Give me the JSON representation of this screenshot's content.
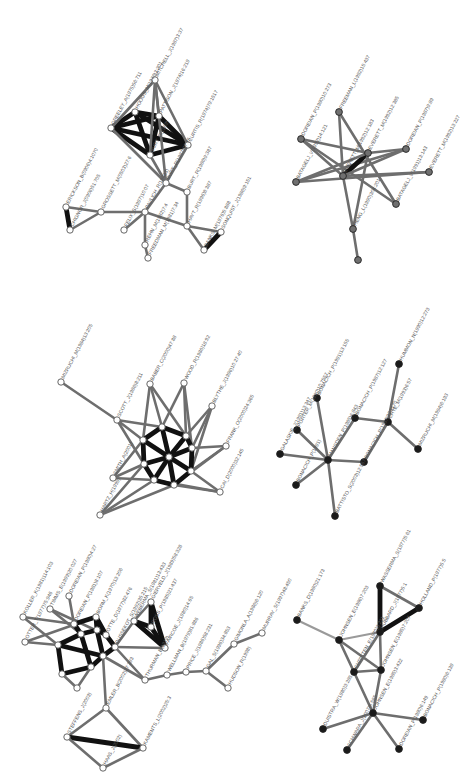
{
  "figure": {
    "colors": {
      "edge_light": "#9a9a9a",
      "edge_mid": "#6e6e6e",
      "edge_dark": "#111111",
      "node_white_fill": "#ffffff",
      "node_gray_fill": "#707070",
      "node_black_fill": "#1a1a1a",
      "node_stroke": "#555555"
    }
  },
  "graphs": [
    {
      "id": "top-left",
      "node_style": "white",
      "nodes": [
        {
          "id": "n1",
          "label": "ERICKSON_B(0906)4:1070",
          "x": 66,
          "y": 207
        },
        {
          "id": "n2",
          "label": "CHIGNOR_J(0906)51:705",
          "x": 70,
          "y": 230
        },
        {
          "id": "n3",
          "label": "GROSSETT_M(0503)27:6",
          "x": 101,
          "y": 212
        },
        {
          "id": "n4",
          "label": "FELIX_S(1997)10:07",
          "x": 124,
          "y": 230
        },
        {
          "id": "n5",
          "label": "PAVLICH_R(19833)",
          "x": 145,
          "y": 212
        },
        {
          "id": "n6",
          "label": "REHN_M(1982)7:4",
          "x": 145,
          "y": 245
        },
        {
          "id": "n7",
          "label": "FREEDMAN_M(1981)7:34",
          "x": 148,
          "y": 258
        },
        {
          "id": "n8",
          "label": "BURT_R(1987)37:75",
          "x": 166,
          "y": 183
        },
        {
          "id": "n9",
          "label": "BURT_R(1986)9:387",
          "x": 187,
          "y": 192
        },
        {
          "id": "n10",
          "label": "HAYT_R(1996)8:387",
          "x": 187,
          "y": 226
        },
        {
          "id": "n11",
          "label": "BANKS_M(1976)5:888",
          "x": 204,
          "y": 250
        },
        {
          "id": "n12",
          "label": "SONQUIST_J(1986)9:151",
          "x": 221,
          "y": 232
        },
        {
          "id": "n13",
          "label": "GREELEY_A(1975)56:711",
          "x": 111,
          "y": 128
        },
        {
          "id": "n14",
          "label": "HOOGS_M(1976)3:301",
          "x": 135,
          "y": 112
        },
        {
          "id": "n15",
          "label": "MITCHELL_J(1987)3:37",
          "x": 155,
          "y": 80
        },
        {
          "id": "n16",
          "label": "PATTISON_J(1974)16:219",
          "x": 159,
          "y": 116
        },
        {
          "id": "n17",
          "label": "CURTIS_R(1974)79:1517",
          "x": 188,
          "y": 145
        },
        {
          "id": "n18",
          "label": "BURT_R(1989)",
          "x": 150,
          "y": 155
        }
      ]
    },
    {
      "id": "top-right",
      "node_style": "gray",
      "nodes": [
        {
          "id": "m1",
          "label": "DOREIAN_P(1980)10:273",
          "x": 301,
          "y": 139
        },
        {
          "id": "m2",
          "label": "BATAGELJ_V(1992)14:121",
          "x": 296,
          "y": 182
        },
        {
          "id": "m3",
          "label": "FREEMAN_L(1992)15:437",
          "x": 339,
          "y": 112
        },
        {
          "id": "m4",
          "label": "EVERETT_M(1992)12:183",
          "x": 343,
          "y": 176
        },
        {
          "id": "m5",
          "label": "EVERETT_M(1992)12:385",
          "x": 368,
          "y": 153
        },
        {
          "id": "m6",
          "label": "DOREIAN_P(1987)9:89",
          "x": 406,
          "y": 149
        },
        {
          "id": "m7",
          "label": "BATAGELJ_V(1991)13:143",
          "x": 396,
          "y": 204
        },
        {
          "id": "m8",
          "label": "EVERETT_M(1992)13:227",
          "x": 429,
          "y": 172
        },
        {
          "id": "m9",
          "label": "HENG_L(1990)304:201",
          "x": 353,
          "y": 229
        },
        {
          "id": "m10",
          "label": "",
          "x": 358,
          "y": 260
        }
      ]
    },
    {
      "id": "middle-left",
      "node_style": "white",
      "nodes": [
        {
          "id": "s1",
          "label": "MIZRUCHI_M(1984)13:205",
          "x": 61,
          "y": 382
        },
        {
          "id": "s2",
          "label": "SCOTT_J(1986)8:211",
          "x": 117,
          "y": 420
        },
        {
          "id": "s3",
          "label": "BABER_C(2000)47:88",
          "x": 150,
          "y": 384
        },
        {
          "id": "s4",
          "label": "WOOD_R(1986)18:92",
          "x": 184,
          "y": 383
        },
        {
          "id": "s5",
          "label": "BLYTHE_J(1996)10:27:40",
          "x": 212,
          "y": 406
        },
        {
          "id": "s6",
          "label": "FRANK_O(2000)24:365",
          "x": 226,
          "y": 446
        },
        {
          "id": "s7",
          "label": "CAI_D(2000)32:145",
          "x": 220,
          "y": 492
        },
        {
          "id": "s8",
          "label": "SMITH_A(2001)",
          "x": 113,
          "y": 478
        },
        {
          "id": "s9",
          "label": "HARTZ_H(1999)",
          "x": 100,
          "y": 515
        },
        {
          "id": "s10",
          "label": "",
          "x": 162,
          "y": 427
        },
        {
          "id": "s11",
          "label": "",
          "x": 186,
          "y": 436
        },
        {
          "id": "s12",
          "label": "",
          "x": 143,
          "y": 440
        },
        {
          "id": "s13",
          "label": "",
          "x": 192,
          "y": 448
        },
        {
          "id": "s14",
          "label": "",
          "x": 169,
          "y": 457
        },
        {
          "id": "s15",
          "label": "",
          "x": 144,
          "y": 464
        },
        {
          "id": "s16",
          "label": "",
          "x": 191,
          "y": 471
        },
        {
          "id": "s17",
          "label": "",
          "x": 154,
          "y": 480
        },
        {
          "id": "s18",
          "label": "",
          "x": 174,
          "y": 485
        }
      ]
    },
    {
      "id": "middle-right",
      "node_style": "black",
      "nodes": [
        {
          "id": "b1",
          "label": "HUMMON_N(1990)12:273",
          "x": 399,
          "y": 364
        },
        {
          "id": "b2",
          "label": "CHYE_M(1993)6:57",
          "x": 388,
          "y": 422
        },
        {
          "id": "b3",
          "label": "MIZRUCHI_M(1994)6:193",
          "x": 418,
          "y": 449
        },
        {
          "id": "b4",
          "label": "BONACICH_P(1987)12:127",
          "x": 355,
          "y": 418
        },
        {
          "id": "b5",
          "label": "BONACICH_P(1987)92:1170",
          "x": 364,
          "y": 462
        },
        {
          "id": "b6",
          "label": "PORTER_M(1990)10:7557",
          "x": 297,
          "y": 430
        },
        {
          "id": "b7",
          "label": "BONACICH_P(1991)13:155",
          "x": 317,
          "y": 398
        },
        {
          "id": "b8",
          "label": "GALASKIE_J(1991)13:347",
          "x": 280,
          "y": 454
        },
        {
          "id": "b9",
          "label": "MANSDEN_P(1985)6:843",
          "x": 328,
          "y": 460
        },
        {
          "id": "b10",
          "label": "BONACICH_P(1991)",
          "x": 296,
          "y": 485
        },
        {
          "id": "b11",
          "label": "BATTISTO_S(2003)12:567",
          "x": 335,
          "y": 516
        }
      ]
    },
    {
      "id": "bottom-left",
      "node_style": "white",
      "nodes": [
        {
          "id": "w1",
          "label": "KOLLER_K(1981)114:103",
          "x": 23,
          "y": 617
        },
        {
          "id": "w2",
          "label": "OTTER_T(1977)75:946",
          "x": 25,
          "y": 642
        },
        {
          "id": "w3",
          "label": "TIMMS_E(1999)20:027",
          "x": 50,
          "y": 609
        },
        {
          "id": "w4",
          "label": "DOREIAN_P(1980)4:27",
          "x": 69,
          "y": 596
        },
        {
          "id": "w5",
          "label": "DOREIAN_P(1981)8:107",
          "x": 74,
          "y": 624
        },
        {
          "id": "w6",
          "label": "BORM_K(1970)13:206",
          "x": 96,
          "y": 617
        },
        {
          "id": "w7",
          "label": "OTTE_D(1977)82:476",
          "x": 106,
          "y": 635
        },
        {
          "id": "w8",
          "label": "DUSSEKOT_S(1992)35:215",
          "x": 115,
          "y": 647
        },
        {
          "id": "w9",
          "label": "WEBERMA_S(1981)13:433",
          "x": 134,
          "y": 621
        },
        {
          "id": "w10",
          "label": "GIERVELD_J(1989)58:328",
          "x": 151,
          "y": 602
        },
        {
          "id": "w11",
          "label": "ROSS_P(1985)21:437",
          "x": 151,
          "y": 627
        },
        {
          "id": "w12",
          "label": "FAIRCOE_J(1980)14:65",
          "x": 165,
          "y": 648
        },
        {
          "id": "w13",
          "label": "THURMAN_B(1979)",
          "x": 145,
          "y": 680
        },
        {
          "id": "w14",
          "label": "WELLMAN_B(1979)81:886",
          "x": 167,
          "y": 675
        },
        {
          "id": "w15",
          "label": "PRICE_J(1986)58:231",
          "x": 186,
          "y": 672
        },
        {
          "id": "w16",
          "label": "GAL_S(1996)34:853",
          "x": 206,
          "y": 671
        },
        {
          "id": "w17",
          "label": "HUDSON_R(1998)",
          "x": 228,
          "y": 688
        },
        {
          "id": "w18",
          "label": "STEFFENS_J(2003)",
          "x": 67,
          "y": 737
        },
        {
          "id": "w19",
          "label": "KAMENTS_L(2002)25:3",
          "x": 143,
          "y": 748
        },
        {
          "id": "w20",
          "label": "EMLER_B(2002)27:393",
          "x": 106,
          "y": 708
        },
        {
          "id": "w21",
          "label": "HAAS_J(2002)",
          "x": 103,
          "y": 768
        },
        {
          "id": "w22",
          "label": "",
          "x": 58,
          "y": 645
        },
        {
          "id": "w23",
          "label": "",
          "x": 81,
          "y": 634
        },
        {
          "id": "w24",
          "label": "",
          "x": 97,
          "y": 630
        },
        {
          "id": "w25",
          "label": "",
          "x": 103,
          "y": 656
        },
        {
          "id": "w26",
          "label": "",
          "x": 91,
          "y": 667
        },
        {
          "id": "w27",
          "label": "",
          "x": 62,
          "y": 674
        },
        {
          "id": "w28",
          "label": "",
          "x": 77,
          "y": 688
        },
        {
          "id": "w29",
          "label": "GIMONLA_A(1986)6:120",
          "x": 234,
          "y": 644
        },
        {
          "id": "w30",
          "label": "MURRAY_S(1997)48:450",
          "x": 262,
          "y": 633
        }
      ]
    },
    {
      "id": "bottom-right",
      "node_style": "black",
      "nodes": [
        {
          "id": "k1",
          "label": "BANKS_D(1980)21:173",
          "x": 297,
          "y": 620
        },
        {
          "id": "k2",
          "label": "JOHNSEN_E(1986)7:203",
          "x": 339,
          "y": 640
        },
        {
          "id": "k3",
          "label": "WASSERMA_S(1977)5:61",
          "x": 380,
          "y": 586
        },
        {
          "id": "k4",
          "label": "HOLLAND_P(1977)5:5",
          "x": 419,
          "y": 608
        },
        {
          "id": "k5",
          "label": "HUBBARD_J(1977)5:1",
          "x": 380,
          "y": 632
        },
        {
          "id": "k6",
          "label": "CHRISTEN_E(1980)3:221",
          "x": 354,
          "y": 672
        },
        {
          "id": "k7",
          "label": "JOHNSEN_E(1985)7:207",
          "x": 381,
          "y": 670
        },
        {
          "id": "k8",
          "label": "JOHNSEN_E(1985)3:422",
          "x": 373,
          "y": 713
        },
        {
          "id": "k9",
          "label": "DUISTRA_W(1980)3:285",
          "x": 323,
          "y": 729
        },
        {
          "id": "k10",
          "label": "BONACICH_P(1980)6:139",
          "x": 423,
          "y": 720
        },
        {
          "id": "k11",
          "label": "DOREIAN_P(1980)6:149",
          "x": 399,
          "y": 749
        },
        {
          "id": "k12",
          "label": "SCHWARA_J(2007)5:565",
          "x": 347,
          "y": 750
        }
      ]
    }
  ]
}
